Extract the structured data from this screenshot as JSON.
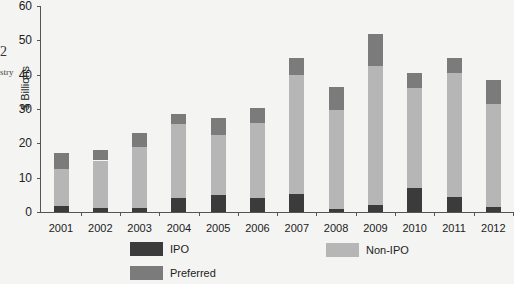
{
  "page": {
    "left_fragment_number": "2",
    "left_fragment_word": "stry"
  },
  "colors": {
    "IPO": "#3b3b3b",
    "Non-IPO": "#b6b6b6",
    "Preferred": "#7b7b7b"
  },
  "chart_data": {
    "type": "bar",
    "stacked": true,
    "title": "",
    "xlabel": "",
    "ylabel": "$ Billions",
    "ylim": [
      0,
      60
    ],
    "yticks": [
      "0",
      "10",
      "20",
      "30",
      "40",
      "50",
      "60"
    ],
    "grid": false,
    "legend_position": "bottom",
    "categories": [
      "2001",
      "2002",
      "2003",
      "2004",
      "2005",
      "2006",
      "2007",
      "2008",
      "2009",
      "2010",
      "2011",
      "2012"
    ],
    "series": [
      {
        "name": "IPO",
        "values": [
          1.7,
          1.1,
          1.1,
          4.0,
          5.0,
          4.0,
          5.2,
          0.9,
          2.0,
          7.1,
          4.5,
          1.4
        ]
      },
      {
        "name": "Non-IPO",
        "values": [
          10.7,
          13.9,
          17.7,
          21.7,
          17.3,
          22.0,
          34.6,
          28.8,
          40.4,
          29.0,
          36.1,
          30.0
        ]
      },
      {
        "name": "Preferred",
        "values": [
          4.7,
          3.1,
          4.1,
          2.9,
          5.0,
          4.2,
          5.2,
          6.8,
          9.5,
          4.5,
          4.2,
          7.1
        ]
      }
    ],
    "legend": [
      "IPO",
      "Non-IPO",
      "Preferred"
    ]
  }
}
